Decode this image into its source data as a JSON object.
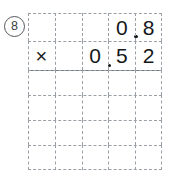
{
  "problem": {
    "number_label": "8",
    "number_marker_style": "circled",
    "type": "vertical-multiplication-worksheet",
    "operator_symbol": "×"
  },
  "grid": {
    "columns": 5,
    "rows": 6,
    "line_style": "dashed",
    "line_color": "#9aa0a6",
    "answer_rule_color": "#6e7378",
    "background": "#ffffff"
  },
  "rows": [
    {
      "name": "multiplicand-row",
      "cells": [
        {
          "text": "",
          "decimal_after": false
        },
        {
          "text": "",
          "decimal_after": false
        },
        {
          "text": "",
          "decimal_after": false
        },
        {
          "text": "0",
          "decimal_after": true
        },
        {
          "text": "8",
          "decimal_after": false
        }
      ]
    },
    {
      "name": "multiplier-row",
      "cells": [
        {
          "text": "×",
          "decimal_after": false
        },
        {
          "text": "",
          "decimal_after": false
        },
        {
          "text": "0",
          "decimal_after": true
        },
        {
          "text": "5",
          "decimal_after": false
        },
        {
          "text": "2",
          "decimal_after": false
        }
      ]
    },
    {
      "name": "work-row-1",
      "cells": [
        {
          "text": "",
          "decimal_after": false
        },
        {
          "text": "",
          "decimal_after": false
        },
        {
          "text": "",
          "decimal_after": false
        },
        {
          "text": "",
          "decimal_after": false
        },
        {
          "text": "",
          "decimal_after": false
        }
      ]
    },
    {
      "name": "work-row-2",
      "cells": [
        {
          "text": "",
          "decimal_after": false
        },
        {
          "text": "",
          "decimal_after": false
        },
        {
          "text": "",
          "decimal_after": false
        },
        {
          "text": "",
          "decimal_after": false
        },
        {
          "text": "",
          "decimal_after": false
        }
      ]
    },
    {
      "name": "work-row-3",
      "cells": [
        {
          "text": "",
          "decimal_after": false
        },
        {
          "text": "",
          "decimal_after": false
        },
        {
          "text": "",
          "decimal_after": false
        },
        {
          "text": "",
          "decimal_after": false
        },
        {
          "text": "",
          "decimal_after": false
        }
      ]
    },
    {
      "name": "answer-row",
      "cells": [
        {
          "text": "",
          "decimal_after": false
        },
        {
          "text": "",
          "decimal_after": false
        },
        {
          "text": "",
          "decimal_after": false
        },
        {
          "text": "",
          "decimal_after": false
        },
        {
          "text": "",
          "decimal_after": false
        }
      ]
    }
  ]
}
